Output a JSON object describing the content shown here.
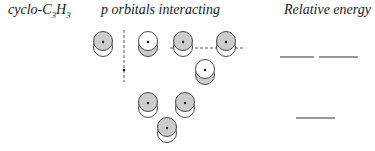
{
  "headings": {
    "molecule": {
      "prefix": "cyclo-C",
      "sub1": "3",
      "mid": "H",
      "sub2": "3"
    },
    "orbitals": "p orbitals interacting",
    "energy": "Relative energy"
  },
  "colors": {
    "shade": "#cccccc",
    "line": "#333333",
    "dashed": "#555555"
  },
  "orbitals": [
    {
      "id": "top-left",
      "cx": 103,
      "cy": 42,
      "shaded_lobe": "top"
    },
    {
      "id": "top-2",
      "cx": 148,
      "cy": 42,
      "shaded_lobe": "bottom"
    },
    {
      "id": "top-3",
      "cx": 183,
      "cy": 42,
      "shaded_lobe": "top"
    },
    {
      "id": "top-4",
      "cx": 226,
      "cy": 42,
      "shaded_lobe": "top"
    },
    {
      "id": "mid-5",
      "cx": 205,
      "cy": 70,
      "shaded_lobe": "bottom"
    },
    {
      "id": "low-1",
      "cx": 148,
      "cy": 103,
      "shaded_lobe": "top"
    },
    {
      "id": "low-2",
      "cx": 185,
      "cy": 103,
      "shaded_lobe": "top"
    },
    {
      "id": "low-3",
      "cx": 167,
      "cy": 128,
      "shaded_lobe": "top"
    }
  ],
  "nodal_lines": [
    {
      "orientation": "vertical",
      "x1": 124,
      "y1": 30,
      "x2": 124,
      "y2": 82,
      "dot_y": 70
    },
    {
      "orientation": "horizontal",
      "x1": 170,
      "y1": 48,
      "x2": 245,
      "y2": 48
    }
  ],
  "energy_levels": [
    {
      "x1": 280,
      "x2": 314,
      "y": 57,
      "label": "degenerate-1"
    },
    {
      "x1": 319,
      "x2": 358,
      "y": 57,
      "label": "degenerate-2"
    },
    {
      "x1": 296,
      "x2": 335,
      "y": 118,
      "label": "lowest"
    }
  ]
}
